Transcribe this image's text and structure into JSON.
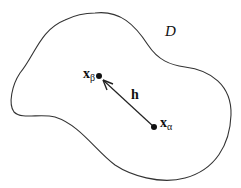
{
  "diagram": {
    "region_label": "D",
    "vector_label": "h",
    "point_beta": {
      "symbol": "x",
      "subscript": "β",
      "x": 99,
      "y": 76
    },
    "point_alpha": {
      "symbol": "x",
      "subscript": "α",
      "x": 154,
      "y": 127
    },
    "colors": {
      "stroke": "#333333",
      "background": "#ffffff"
    }
  }
}
